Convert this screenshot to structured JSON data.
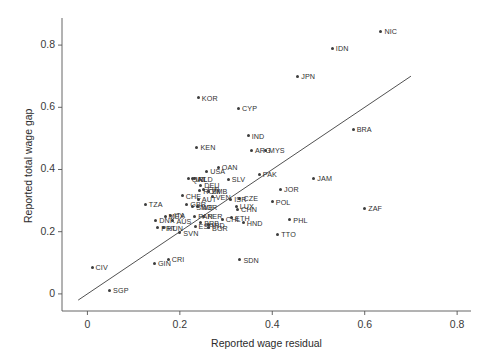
{
  "chart_data": {
    "type": "scatter",
    "title": "",
    "xlabel": "Reported wage residual",
    "ylabel": "Reported total wage gap",
    "xlim": [
      -0.055,
      0.83
    ],
    "ylim": [
      -0.055,
      0.9
    ],
    "xticks": [
      "0",
      "0.2",
      "0.4",
      "0.6",
      "0.8"
    ],
    "xtick_values": [
      0,
      0.2,
      0.4,
      0.6,
      0.8
    ],
    "yticks": [
      "0",
      "0.2",
      "0.4",
      "0.6",
      "0.8"
    ],
    "ytick_values": [
      0,
      0.2,
      0.4,
      0.6,
      0.8
    ],
    "grid": false,
    "legend": "none",
    "reference_line": {
      "name": "45-degree identity line",
      "x": [
        -0.02,
        0.7
      ],
      "y": [
        -0.02,
        0.7
      ],
      "color": "#3d3d3d"
    },
    "point_color": "#3d3d3d",
    "labels_are_country_codes": true,
    "points": [
      {
        "label": "NIC",
        "x": 0.635,
        "y": 0.845
      },
      {
        "label": "IDN",
        "x": 0.53,
        "y": 0.79
      },
      {
        "label": "JPN",
        "x": 0.455,
        "y": 0.7
      },
      {
        "label": "KOR",
        "x": 0.24,
        "y": 0.63
      },
      {
        "label": "CYP",
        "x": 0.327,
        "y": 0.597
      },
      {
        "label": "BRA",
        "x": 0.575,
        "y": 0.53
      },
      {
        "label": "IND",
        "x": 0.348,
        "y": 0.508
      },
      {
        "label": "KEN",
        "x": 0.237,
        "y": 0.472
      },
      {
        "label": "ARG",
        "x": 0.355,
        "y": 0.462
      },
      {
        "label": "MYS",
        "x": 0.385,
        "y": 0.462
      },
      {
        "label": "OAN",
        "x": 0.283,
        "y": 0.408
      },
      {
        "label": "USA",
        "x": 0.258,
        "y": 0.395
      },
      {
        "label": "PAK",
        "x": 0.372,
        "y": 0.385
      },
      {
        "label": "NLD",
        "x": 0.232,
        "y": 0.37
      },
      {
        "label": "QAT",
        "x": 0.218,
        "y": 0.37
      },
      {
        "label": "IRL",
        "x": 0.227,
        "y": 0.37
      },
      {
        "label": "SLV",
        "x": 0.305,
        "y": 0.368
      },
      {
        "label": "JAM",
        "x": 0.49,
        "y": 0.372
      },
      {
        "label": "DEU",
        "x": 0.245,
        "y": 0.35
      },
      {
        "label": "FIN",
        "x": 0.252,
        "y": 0.337
      },
      {
        "label": "JOR",
        "x": 0.418,
        "y": 0.337
      },
      {
        "label": "ROM",
        "x": 0.243,
        "y": 0.332
      },
      {
        "label": "ZMB",
        "x": 0.262,
        "y": 0.33
      },
      {
        "label": "CHE",
        "x": 0.205,
        "y": 0.315
      },
      {
        "label": "VEN",
        "x": 0.27,
        "y": 0.312
      },
      {
        "label": "CZE",
        "x": 0.33,
        "y": 0.308
      },
      {
        "label": "ISR",
        "x": 0.31,
        "y": 0.305
      },
      {
        "label": "AUT",
        "x": 0.24,
        "y": 0.305
      },
      {
        "label": "POL",
        "x": 0.4,
        "y": 0.297
      },
      {
        "label": "GBR",
        "x": 0.215,
        "y": 0.288
      },
      {
        "label": "NOR",
        "x": 0.238,
        "y": 0.28
      },
      {
        "label": "SWE",
        "x": 0.228,
        "y": 0.28
      },
      {
        "label": "LUX",
        "x": 0.322,
        "y": 0.282
      },
      {
        "label": "CHN",
        "x": 0.325,
        "y": 0.272
      },
      {
        "label": "ZAF",
        "x": 0.6,
        "y": 0.275
      },
      {
        "label": "TZA",
        "x": 0.125,
        "y": 0.288
      },
      {
        "label": "MEX",
        "x": 0.168,
        "y": 0.25
      },
      {
        "label": "ITA",
        "x": 0.18,
        "y": 0.253
      },
      {
        "label": "PAN",
        "x": 0.232,
        "y": 0.25
      },
      {
        "label": "PER",
        "x": 0.252,
        "y": 0.25
      },
      {
        "label": "ETH",
        "x": 0.312,
        "y": 0.245
      },
      {
        "label": "CHL",
        "x": 0.292,
        "y": 0.24
      },
      {
        "label": "PHL",
        "x": 0.438,
        "y": 0.238
      },
      {
        "label": "DNK",
        "x": 0.148,
        "y": 0.237
      },
      {
        "label": "AUS",
        "x": 0.185,
        "y": 0.235
      },
      {
        "label": "HND",
        "x": 0.337,
        "y": 0.228
      },
      {
        "label": "BRB",
        "x": 0.245,
        "y": 0.228
      },
      {
        "label": "IND2",
        "x": 0.262,
        "y": 0.222
      },
      {
        "label": "ESP",
        "x": 0.233,
        "y": 0.218
      },
      {
        "label": "BGR",
        "x": 0.262,
        "y": 0.212
      },
      {
        "label": "HUN",
        "x": 0.165,
        "y": 0.212
      },
      {
        "label": "PRT",
        "x": 0.152,
        "y": 0.213
      },
      {
        "label": "TTO",
        "x": 0.412,
        "y": 0.192
      },
      {
        "label": "SVN",
        "x": 0.2,
        "y": 0.197
      },
      {
        "label": "CRI",
        "x": 0.175,
        "y": 0.112
      },
      {
        "label": "SDN",
        "x": 0.33,
        "y": 0.11
      },
      {
        "label": "GIN",
        "x": 0.145,
        "y": 0.098
      },
      {
        "label": "CIV",
        "x": 0.01,
        "y": 0.085
      },
      {
        "label": "SGP",
        "x": 0.048,
        "y": 0.012
      }
    ]
  }
}
